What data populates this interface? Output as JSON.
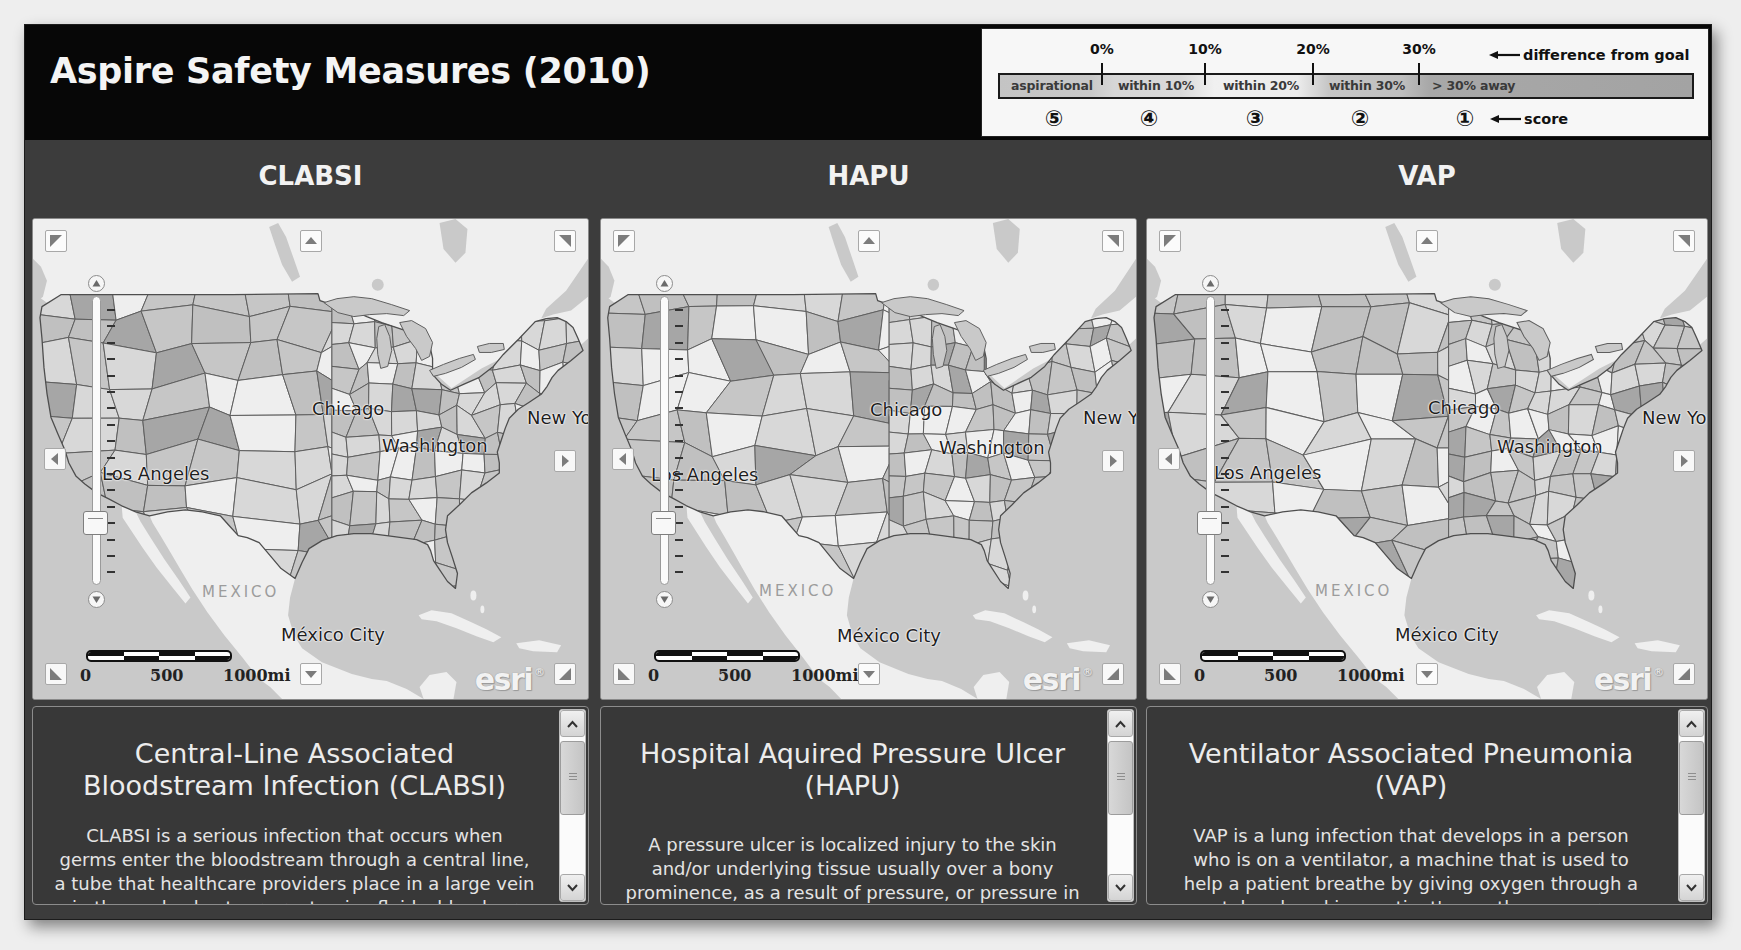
{
  "header": {
    "title": "Aspire Safety Measures (2010)"
  },
  "legend": {
    "ticks": [
      "0%",
      "10%",
      "20%",
      "30%"
    ],
    "axis_caption": "difference from goal",
    "score_caption": "score",
    "bands": [
      {
        "label": "aspirational",
        "score": "⑤",
        "color": "#c6c6c6"
      },
      {
        "label": "within 10%",
        "score": "④",
        "color": "#d8d8d8"
      },
      {
        "label": "within 20%",
        "score": "③",
        "color": "#eeeeee"
      },
      {
        "label": "within 30%",
        "score": "②",
        "color": "#c0c0c0"
      },
      {
        "label": "> 30% away",
        "score": "①",
        "color": "#a6a6a6"
      }
    ]
  },
  "measures": [
    {
      "heading": "CLABSI",
      "map": {
        "labels": {
          "chicago": "Chicago",
          "washington": "Washington",
          "los_angeles": "Los Angeles",
          "new_york": "New York",
          "mexico": "MEXICO",
          "mexico_city": "México City"
        },
        "scale": {
          "zero": "0",
          "mid": "500",
          "max": "1000mi"
        },
        "attribution": "esri",
        "attribution_mark": "®"
      },
      "description": {
        "title_lines": [
          "Central-Line Associated",
          "Bloodstream Infection (CLABSI)"
        ],
        "body_lines": [
          "CLABSI is a serious infection that occurs when",
          "germs enter the bloodstream through a central line,",
          "a tube that healthcare providers place in a large vein",
          "in the neck, chest, or arm to give fluids, blood, or"
        ]
      }
    },
    {
      "heading": "HAPU",
      "map": {
        "labels": {
          "chicago": "Chicago",
          "washington": "Washington",
          "los_angeles": "Los Angeles",
          "new_york": "New York",
          "mexico": "MEXICO",
          "mexico_city": "México City"
        },
        "scale": {
          "zero": "0",
          "mid": "500",
          "max": "1000mi"
        },
        "attribution": "esri",
        "attribution_mark": "®"
      },
      "description": {
        "title_lines": [
          "Hospital Aquired Pressure Ulcer",
          "(HAPU)"
        ],
        "body_lines": [
          "A pressure ulcer is localized injury to the skin",
          "and/or underlying tissue usually over a bony",
          "prominence, as a result of pressure, or pressure in"
        ]
      }
    },
    {
      "heading": "VAP",
      "map": {
        "labels": {
          "chicago": "Chicago",
          "washington": "Washington",
          "los_angeles": "Los Angeles",
          "new_york": "New York",
          "mexico": "MEXICO",
          "mexico_city": "México City"
        },
        "scale": {
          "zero": "0",
          "mid": "500",
          "max": "1000mi"
        },
        "attribution": "esri",
        "attribution_mark": "®"
      },
      "description": {
        "title_lines": [
          "Ventilator Associated Pneumonia",
          "(VAP)"
        ],
        "body_lines": [
          "VAP is a lung infection that develops in a person",
          "who is on a ventilator, a machine that is used to",
          "help a patient breathe by giving oxygen through a",
          "tube placed in a patient's mouth, nose, or"
        ]
      }
    }
  ],
  "colors": {
    "header_bg": "#070707",
    "dashboard_bg": "#3c3c3c",
    "panel_bg": "#383838",
    "map_water": "#c9c9c9",
    "map_land": "#efefef",
    "region_border": "#5e5e5e"
  }
}
